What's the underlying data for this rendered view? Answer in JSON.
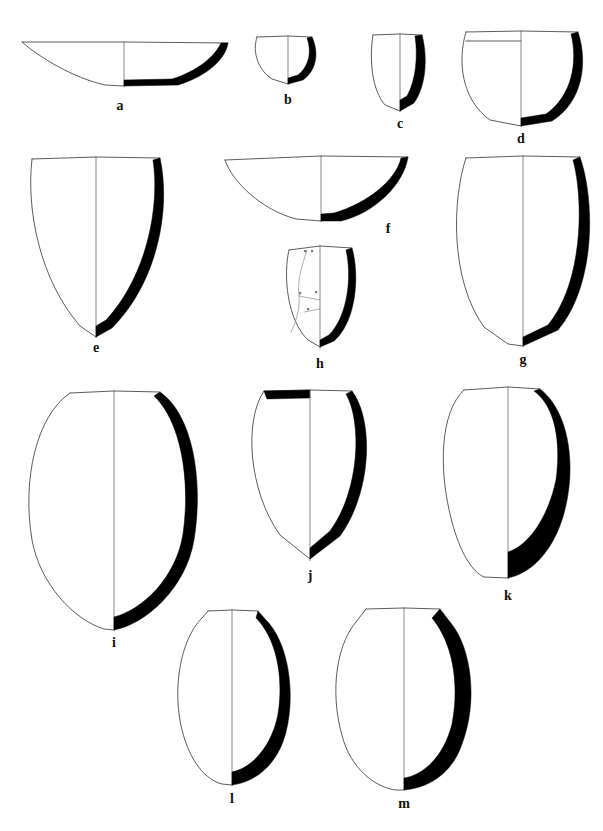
{
  "figure": {
    "background_color": "#ffffff",
    "ink_color": "#000000",
    "outline_color": "#0d0d0d",
    "section_fill": "#000000",
    "centerline_color": "#6b6b6b",
    "convention": "left half = exterior profile, right half = wall cross-section",
    "vessel_count": 13
  },
  "vessels": [
    {
      "id": "a",
      "label": "a",
      "label_x": 120,
      "label_y": 110,
      "row": 1,
      "form": "shallow open bowl",
      "rim_y": 42,
      "base_y": 87,
      "left_x": 22,
      "right_x": 228,
      "center_x": 124,
      "width": 206,
      "height": 45,
      "has_rim_band": false,
      "rim_band_filled": false,
      "has_cracks": false,
      "left_path": "M22,42 C40,58 74,78 105,85 L124,86",
      "rim_left_path": "M22,42 L124,42",
      "rim_right_path": "M124,42 L228,43",
      "section_path": "M228,43 C226,58 208,76 178,85 L124,86 L124,80 L172,79 C198,71 215,56 221,43 Z"
    },
    {
      "id": "b",
      "label": "b",
      "label_x": 288,
      "label_y": 104,
      "row": 1,
      "form": "small hemispherical cup",
      "rim_y": 36,
      "base_y": 85,
      "left_x": 256,
      "right_x": 320,
      "center_x": 288,
      "width": 64,
      "height": 49,
      "has_rim_band": false,
      "rim_band_filled": false,
      "has_cracks": false,
      "left_path": "M257,37 C252,52 258,70 272,79 L288,84",
      "rim_left_path": "M257,37 L288,36",
      "rim_right_path": "M288,36 L312,37",
      "section_path": "M312,37 C319,52 317,70 303,80 L288,84 L288,78 L298,75 C309,66 312,52 307,38 Z"
    },
    {
      "id": "c",
      "label": "c",
      "label_x": 400,
      "label_y": 128,
      "row": 1,
      "form": "deep beaker / small jar",
      "rim_y": 34,
      "base_y": 112,
      "left_x": 371,
      "right_x": 428,
      "center_x": 400,
      "width": 57,
      "height": 78,
      "has_rim_band": false,
      "rim_band_filled": false,
      "has_cracks": false,
      "left_path": "M373,35 C369,60 372,90 385,105 L400,111",
      "rim_left_path": "M373,35 L400,34",
      "rim_right_path": "M400,34 L422,35",
      "section_path": "M422,35 C428,58 426,86 414,103 L400,111 L400,100 L407,96 C416,80 418,56 415,36 Z"
    },
    {
      "id": "d",
      "label": "d",
      "label_x": 521,
      "label_y": 143,
      "row": 1,
      "form": "rounded-base jar with rim band",
      "rim_y": 31,
      "base_y": 127,
      "left_x": 461,
      "right_x": 585,
      "center_x": 521,
      "width": 124,
      "height": 96,
      "has_rim_band": true,
      "rim_band_filled": false,
      "rim_band_y": 41,
      "has_cracks": false,
      "left_path": "M466,32 C457,62 462,100 490,120 L521,126",
      "rim_left_path": "M466,32 L521,31",
      "rim_right_path": "M521,31 L578,32",
      "section_path": "M578,32 C588,62 583,102 552,121 L521,126 L521,118 L546,114 C572,96 578,62 571,34 Z"
    },
    {
      "id": "e",
      "label": "e",
      "label_x": 96,
      "label_y": 352,
      "row": 2,
      "form": "large pointed-base jar",
      "rim_y": 157,
      "base_y": 338,
      "left_x": 30,
      "right_x": 166,
      "center_x": 96,
      "width": 136,
      "height": 181,
      "has_rim_band": false,
      "rim_band_filled": false,
      "has_cracks": false,
      "left_path": "M32,159 C26,210 40,280 80,326 L96,337",
      "rim_left_path": "M32,159 L96,157",
      "rim_right_path": "M96,157 L160,158",
      "section_path": "M160,158 C171,208 158,282 112,328 L96,337 L96,326 L106,320 C147,276 160,206 153,160 Z"
    },
    {
      "id": "f",
      "label": "f",
      "label_x": 388,
      "label_y": 233,
      "row": 2,
      "form": "shallow carinated bowl",
      "rim_y": 156,
      "base_y": 222,
      "left_x": 222,
      "right_x": 412,
      "center_x": 321,
      "width": 190,
      "height": 66,
      "has_rim_band": false,
      "rim_band_filled": false,
      "has_cracks": false,
      "left_path": "M225,160 C232,182 262,210 296,219 L321,221",
      "rim_left_path": "M225,160 L321,156",
      "rim_right_path": "M321,156 L408,157",
      "section_path": "M408,157 C404,184 375,213 341,221 L321,221 L321,214 L334,213 C368,203 396,180 401,158 Z"
    },
    {
      "id": "g",
      "label": "g",
      "label_x": 523,
      "label_y": 364,
      "row": 2,
      "form": "tall ovoid jar, rounded base",
      "rim_y": 156,
      "base_y": 347,
      "left_x": 462,
      "right_x": 588,
      "center_x": 523,
      "width": 126,
      "height": 191,
      "has_rim_band": false,
      "rim_band_filled": false,
      "has_cracks": false,
      "left_path": "M466,158 C452,200 450,280 484,327 L508,344 L523,346",
      "rim_left_path": "M466,158 L523,156",
      "rim_right_path": "M523,156 L580,157",
      "section_path": "M580,157 C595,200 596,285 558,330 L523,346 L523,337 L548,325 C583,283 584,200 573,160 Z"
    },
    {
      "id": "h",
      "label": "h",
      "label_x": 320,
      "label_y": 368,
      "row": 2,
      "form": "small ovoid jar with repair cracks",
      "rim_y": 246,
      "base_y": 349,
      "left_x": 287,
      "right_x": 358,
      "center_x": 320,
      "width": 71,
      "height": 103,
      "has_rim_band": false,
      "rim_band_filled": false,
      "has_cracks": true,
      "crack_paths": [
        "M307,250 C302,266 297,280 299,296 C300,310 296,322 291,332",
        "M299,296 L320,300",
        "M304,312 L320,309"
      ],
      "crack_ticks": [
        {
          "x": 304,
          "y": 250
        },
        {
          "x": 311,
          "y": 250
        },
        {
          "x": 299,
          "y": 292
        },
        {
          "x": 315,
          "y": 291
        },
        {
          "x": 307,
          "y": 308
        }
      ],
      "left_path": "M289,250 C283,275 287,320 308,340 L320,347",
      "rim_left_path": "M289,250 L320,246",
      "rim_right_path": "M320,246 L352,248",
      "section_path": "M352,248 C360,276 356,322 334,341 L320,347 L320,340 L329,335 C348,316 352,276 346,250 Z"
    },
    {
      "id": "i",
      "label": "i",
      "label_x": 114,
      "label_y": 647,
      "row": 3,
      "form": "very large ovoid storage jar",
      "rim_y": 391,
      "base_y": 631,
      "left_x": 25,
      "right_x": 198,
      "center_x": 114,
      "width": 173,
      "height": 240,
      "has_rim_band": false,
      "rim_band_filled": false,
      "has_cracks": false,
      "left_path": "M70,393 C36,416 22,480 32,540 C40,584 74,620 104,629 L114,630",
      "rim_left_path": "M70,393 L114,391",
      "rim_right_path": "M114,391 L160,392",
      "section_path": "M160,392 C192,414 204,478 194,540 C186,588 146,624 114,630 L114,617 C142,610 176,578 183,534 C191,478 180,420 154,396 Z"
    },
    {
      "id": "j",
      "label": "j",
      "label_x": 310,
      "label_y": 580,
      "row": 3,
      "form": "globular jar with black rim band",
      "rim_y": 390,
      "base_y": 561,
      "left_x": 250,
      "right_x": 370,
      "center_x": 310,
      "width": 120,
      "height": 171,
      "has_rim_band": true,
      "rim_band_filled": true,
      "rim_band_y": 393,
      "rim_band_path": "M264,391 L310,390 L310,398 L267,399 Z",
      "has_cracks": false,
      "left_path": "M264,391 C244,420 248,490 280,535 L310,559",
      "rim_left_path": "M264,391 L310,390",
      "rim_right_path": "M310,390 L352,391",
      "section_path": "M352,391 C374,420 372,492 340,536 L310,559 L310,548 L330,531 C360,490 362,422 346,394 Z"
    },
    {
      "id": "k",
      "label": "k",
      "label_x": 508,
      "label_y": 600,
      "row": 3,
      "form": "thick-walled jar, flat base",
      "rim_y": 387,
      "base_y": 579,
      "left_x": 441,
      "right_x": 578,
      "center_x": 508,
      "width": 137,
      "height": 192,
      "has_rim_band": false,
      "rim_band_filled": false,
      "has_cracks": false,
      "left_path": "M464,390 C440,412 438,470 452,522 C460,552 472,572 484,577 L508,578",
      "rim_left_path": "M464,390 L508,387",
      "rim_right_path": "M508,387 L540,389",
      "section_path": "M540,389 C570,412 578,470 562,520 C550,556 528,574 508,578 L508,552 C528,546 548,518 556,480 C562,434 552,404 534,391 Z"
    },
    {
      "id": "l",
      "label": "l",
      "label_x": 232,
      "label_y": 803,
      "row": 4,
      "form": "ovoid jar with short neck",
      "rim_y": 610,
      "base_y": 786,
      "left_x": 172,
      "right_x": 292,
      "center_x": 232,
      "width": 120,
      "height": 176,
      "has_rim_band": false,
      "rim_band_filled": false,
      "has_cracks": false,
      "left_path": "M208,611 L202,618 C180,640 172,690 182,730 C190,762 206,780 222,784 L232,785",
      "rim_left_path": "M208,611 L232,610",
      "rim_right_path": "M232,610 L258,611",
      "section_path": "M258,611 L266,620 C288,642 296,692 286,732 C278,764 256,782 232,785 L232,772 C252,768 272,746 278,714 C284,676 276,638 256,618 Z"
    },
    {
      "id": "m",
      "label": "m",
      "label_x": 404,
      "label_y": 808,
      "row": 4,
      "form": "broad ovoid jar",
      "rim_y": 608,
      "base_y": 790,
      "left_x": 336,
      "right_x": 466,
      "center_x": 404,
      "width": 130,
      "height": 182,
      "has_rim_band": false,
      "rim_band_filled": false,
      "has_cracks": false,
      "left_path": "M366,609 L356,622 C334,648 330,700 344,742 C354,772 378,788 396,790 L404,790",
      "rim_left_path": "M366,609 L404,608",
      "rim_right_path": "M404,608 L440,609",
      "section_path": "M440,609 L450,622 C472,648 478,702 462,744 C452,774 428,788 404,790 L404,778 C424,775 444,756 452,724 C460,682 452,642 432,618 Z"
    }
  ]
}
